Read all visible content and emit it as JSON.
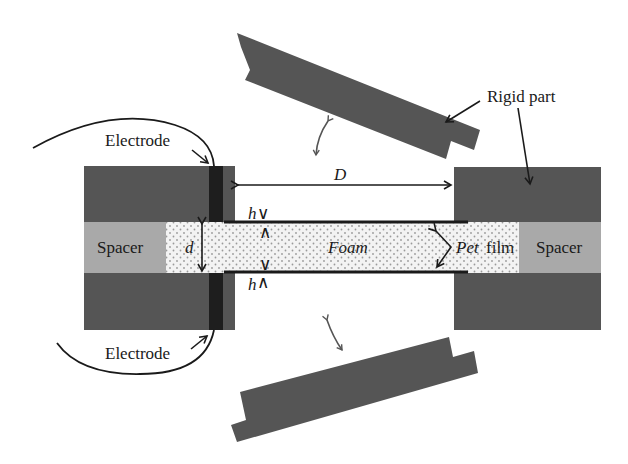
{
  "diagram": {
    "labels": {
      "electrode_top": "Electrode",
      "electrode_bottom": "Electrode",
      "rigid_part": "Rigid part",
      "spacer_left": "Spacer",
      "spacer_right": "Spacer",
      "foam": "Foam",
      "pet": "Pet",
      "film": "film",
      "gap_D": "D",
      "thickness_d": "d",
      "h_top": "h",
      "h_bottom": "h",
      "h_top_mark": "∨",
      "h_top_mark2": "∧",
      "h_bottom_mark": "∨",
      "h_bottom_mark2": "∧"
    },
    "colors": {
      "rigid": "#555555",
      "spacer": "#a9a9a9",
      "electrode": "#1e1e1e",
      "foam_bg": "#f2f2f2",
      "foam_dot": "#9a9a9a",
      "line": "#1a1a1a"
    }
  }
}
